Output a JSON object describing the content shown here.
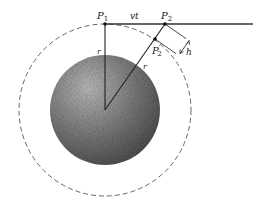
{
  "diagram": {
    "type": "geometry",
    "labels": {
      "p1": "P",
      "p1_sub": "1",
      "p2": "P",
      "p2_sub": "2",
      "p2prime": "P",
      "p2prime_sup": "′",
      "p2prime_sub": "2",
      "vt": "vt",
      "r_vertical": "r",
      "r_slanted": "r",
      "h": "h"
    },
    "colors": {
      "line": "#333333",
      "dashed_circle": "#555555",
      "sphere_light": "#b8b8b8",
      "sphere_dark": "#4a4a4a"
    },
    "geometry": {
      "center": [
        105,
        110
      ],
      "sphere_radius": 55,
      "orbit_radius": 86,
      "p1": [
        105,
        24
      ],
      "p2": [
        165,
        24
      ],
      "p2prime": [
        155,
        39
      ],
      "tangent_end_x": 253
    }
  }
}
